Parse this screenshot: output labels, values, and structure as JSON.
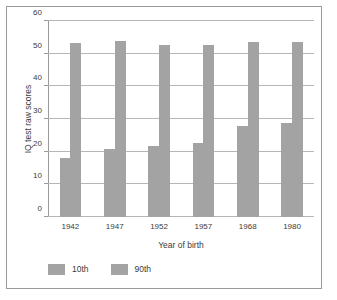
{
  "chart_data": {
    "type": "bar",
    "title": "",
    "xlabel": "Year of birth",
    "ylabel": "IQ test raw scores",
    "categories": [
      "1942",
      "1947",
      "1952",
      "1957",
      "1968",
      "1980"
    ],
    "series": [
      {
        "name": "10th",
        "values": [
          18,
          20.8,
          21.8,
          22.7,
          27.8,
          28.8
        ],
        "color": "#a3a3a3"
      },
      {
        "name": "90th",
        "values": [
          53.2,
          53.8,
          52.8,
          52.7,
          53.6,
          53.5
        ],
        "color": "#a3a3a3"
      }
    ],
    "ylim": [
      0,
      60
    ],
    "yticks": [
      0,
      10,
      20,
      30,
      40,
      50,
      60
    ],
    "ytick_labels": [
      "0",
      "10",
      "20",
      "30",
      "40",
      "50",
      "60"
    ],
    "grid": true,
    "legend_position": "bottom-left",
    "legend": [
      "10th",
      "90th"
    ]
  },
  "figure": {
    "background_color": "#ffffff",
    "border_color": "#9a9a9a",
    "grid_color": "#b6b6b6",
    "text_color": "#3b3b3b"
  }
}
